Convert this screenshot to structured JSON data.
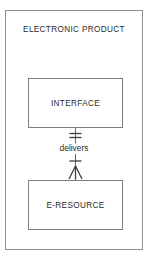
{
  "diagram": {
    "container": {
      "title": "ELECTRONIC PRODUCT"
    },
    "entities": [
      {
        "id": "interface",
        "label": "INTERFACE"
      },
      {
        "id": "e-resource",
        "label": "E-RESOURCE"
      }
    ],
    "relationship": {
      "label": "delivers",
      "from": "INTERFACE",
      "to": "E-RESOURCE",
      "from_cardinality": "one-and-only-one",
      "to_cardinality": "one-to-many",
      "from_symbol": "double-tick",
      "to_symbol": "tick-and-crows-foot"
    },
    "style": {
      "line_color": "#6e6e6e",
      "frame_color": "#8d8d8d",
      "entity_border_color": "#7d7d7d",
      "text_color": "#2b2b2b",
      "background": "#ffffff"
    }
  }
}
